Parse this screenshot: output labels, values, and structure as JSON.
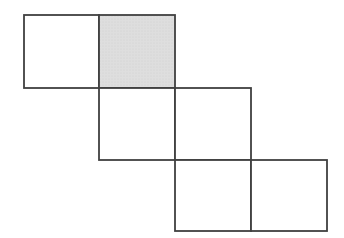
{
  "figure": {
    "type": "staircase-of-squares",
    "background_color": "#ffffff",
    "line_color": "#404040",
    "line_width": 1.8,
    "shaded_fill": "#dedede",
    "stipple_dot_color": "#cccccc",
    "canvas": {
      "width": 344,
      "height": 238
    },
    "grid_x_lines": [
      24,
      99,
      175,
      251,
      327
    ],
    "grid_y_lines": [
      15,
      88,
      160,
      231
    ],
    "squares": [
      {
        "row": 0,
        "col": 0,
        "x": 24,
        "y": 15,
        "w": 75,
        "h": 73,
        "shaded": false
      },
      {
        "row": 0,
        "col": 1,
        "x": 99,
        "y": 15,
        "w": 76,
        "h": 73,
        "shaded": true
      },
      {
        "row": 1,
        "col": 1,
        "x": 99,
        "y": 88,
        "w": 76,
        "h": 72,
        "shaded": false
      },
      {
        "row": 1,
        "col": 2,
        "x": 175,
        "y": 88,
        "w": 76,
        "h": 72,
        "shaded": false
      },
      {
        "row": 2,
        "col": 2,
        "x": 175,
        "y": 160,
        "w": 76,
        "h": 71,
        "shaded": false
      },
      {
        "row": 2,
        "col": 3,
        "x": 251,
        "y": 160,
        "w": 76,
        "h": 71,
        "shaded": false
      }
    ]
  }
}
